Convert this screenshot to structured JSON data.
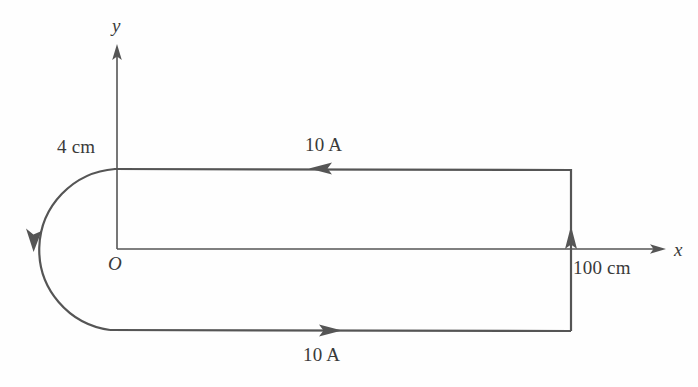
{
  "figure": {
    "background_color": "#fefefe",
    "stroke_color": "#555555",
    "text_color": "#3a3a3a"
  },
  "axes": {
    "y_label": "y",
    "x_label": "x",
    "origin_label": "O",
    "origin_px": {
      "x": 117,
      "y": 249
    },
    "y_axis_top_px": 44,
    "x_axis_right_px": 666
  },
  "labels": {
    "radius": "4 cm",
    "length": "100 cm",
    "current_top": "10 A",
    "current_bottom": "10 A"
  },
  "circuit": {
    "top_wire": {
      "name": "top-straight-wire",
      "y_px": 168,
      "x_start_px": 115,
      "x_end_px": 571,
      "current_label": "10 A",
      "current_direction": "left"
    },
    "bottom_wire": {
      "name": "bottom-straight-wire",
      "y_px": 330,
      "x_start_px": 110,
      "x_end_px": 571,
      "current_label": "10 A",
      "current_direction": "right"
    },
    "right_wire": {
      "name": "right-vertical-wire",
      "x_px": 571,
      "y_top_px": 168,
      "y_bottom_px": 330,
      "current_direction": "up",
      "length_label": "100 cm"
    },
    "semicircle": {
      "name": "left-semicircular-arc",
      "center_px": {
        "x": 113,
        "y": 249
      },
      "radius_px": 84,
      "radius_label": "4 cm",
      "current_direction": "clockwise-down-left"
    }
  }
}
